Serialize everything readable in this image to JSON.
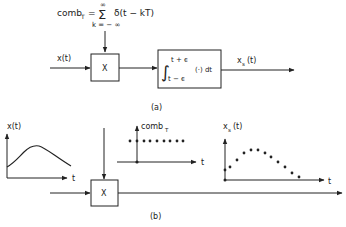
{
  "part_a": {
    "caption": "(a)",
    "comb_formula": {
      "lhs": "comb",
      "lhs_sub": "T",
      "eq": "=",
      "sum_symbol": "Σ",
      "sum_upper": "∞",
      "sum_lower": "k = − ∞",
      "term": "δ(t − kT)"
    },
    "input_label": "x(t)",
    "multiplier_symbol": "X",
    "integrator": {
      "integral_symbol": "∫",
      "upper_limit": "t + ϵ",
      "lower_limit": "t − ϵ",
      "integrand": "(·) dt"
    },
    "output_label": "x",
    "output_sub": "s",
    "output_arg": "(t)"
  },
  "part_b": {
    "caption": "(b)",
    "multiplier_symbol": "X",
    "signal_plot": {
      "label": "x(t)",
      "axis_t": "t"
    },
    "comb_plot": {
      "label": "comb",
      "label_sub": "T",
      "axis_t": "t"
    },
    "sampled_plot": {
      "label": "x",
      "label_sub": "s",
      "label_arg": "(t)",
      "axis_t": "t"
    }
  },
  "colors": {
    "ink": "#222222",
    "background": "#ffffff"
  }
}
